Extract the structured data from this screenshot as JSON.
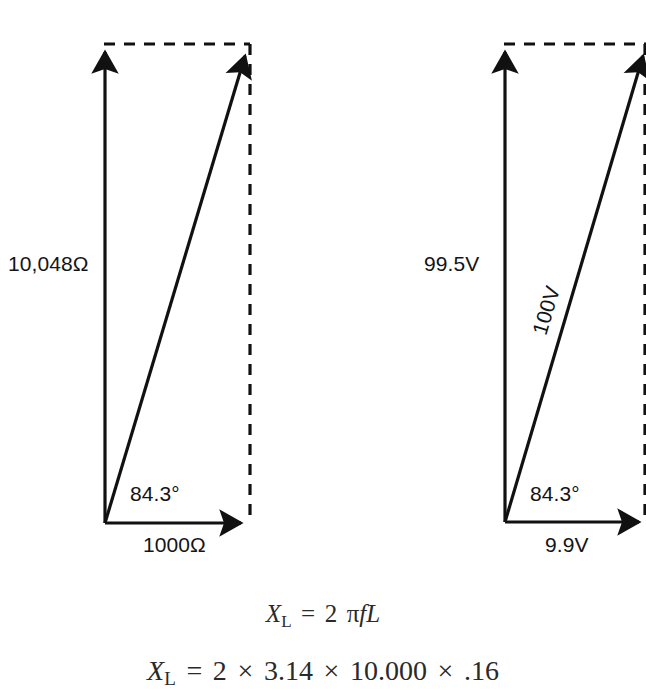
{
  "figure": {
    "type": "phasor-vector-diagram-pair",
    "background_color": "#ffffff",
    "stroke_color": "#111111",
    "text_color": "#141414"
  },
  "diagrams": [
    {
      "id": "impedance-phasor-diagram",
      "quantity": "impedance",
      "unit": "Ω",
      "vertical_label": "10,048Ω",
      "horizontal_label": "1000Ω",
      "angle_label": "84.3°",
      "resultant_label": "",
      "origin": [
        105,
        523
      ],
      "vertical_tip": [
        105,
        47
      ],
      "horizontal_tip": [
        247,
        523
      ],
      "resultant_tip": [
        247,
        50
      ]
    },
    {
      "id": "voltage-phasor-diagram",
      "quantity": "voltage",
      "unit": "V",
      "vertical_label": "99.5V",
      "horizontal_label": "9.9V",
      "angle_label": "84.3°",
      "resultant_label": "100V",
      "origin": [
        505,
        522
      ],
      "vertical_tip": [
        505,
        47
      ],
      "horizontal_tip": [
        645,
        522
      ],
      "resultant_tip": [
        645,
        50
      ]
    }
  ],
  "formulas": {
    "line1": {
      "lhs_var": "X",
      "lhs_sub": "L",
      "equals": "=",
      "rhs": "2",
      "pi": "π",
      "f": "f",
      "L": "L",
      "plain": "Xʟ = 2 πfL"
    },
    "line2": {
      "lhs_var": "X",
      "lhs_sub": "L",
      "equals": "=",
      "term1": "2",
      "times": "×",
      "term2": "3.14",
      "term3": "10.000",
      "term4": ".16",
      "plain": "Xʟ = 2 × 3.14 × 10.000 × .16"
    }
  }
}
